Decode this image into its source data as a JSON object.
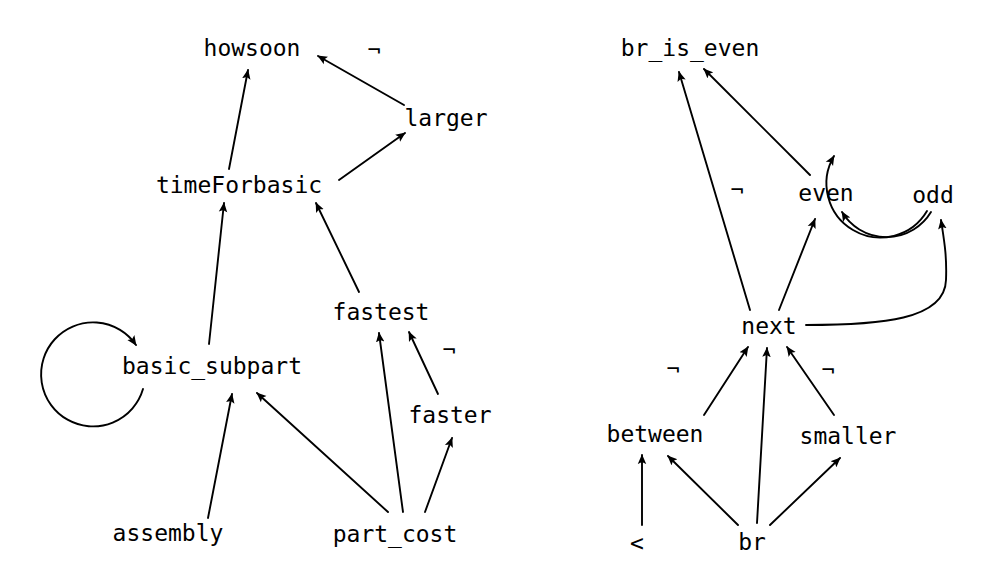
{
  "diagram": {
    "background_color": "#ffffff",
    "stroke_color": "#000000",
    "negation_symbol": "¬",
    "graphs": [
      {
        "id": "left-graph",
        "name": "assembly-cost-dependency-graph",
        "nodes": [
          {
            "id": "howsoon",
            "label": "howsoon",
            "x": 252,
            "y": 48
          },
          {
            "id": "larger",
            "label": "larger",
            "x": 446,
            "y": 118
          },
          {
            "id": "timeForbasic",
            "label": "timeForbasic",
            "x": 239,
            "y": 185
          },
          {
            "id": "fastest",
            "label": "fastest",
            "x": 381,
            "y": 312
          },
          {
            "id": "basic_subpart",
            "label": "basic_subpart",
            "x": 212,
            "y": 366
          },
          {
            "id": "faster",
            "label": "faster",
            "x": 450,
            "y": 415
          },
          {
            "id": "assembly",
            "label": "assembly",
            "x": 168,
            "y": 533
          },
          {
            "id": "part_cost",
            "label": "part_cost",
            "x": 395,
            "y": 534
          }
        ],
        "negations": [
          {
            "id": "neg-larger-howsoon",
            "label": "¬",
            "x": 374,
            "y": 50
          },
          {
            "id": "neg-faster-fastest",
            "label": "¬",
            "x": 449,
            "y": 350
          }
        ],
        "edges": [
          {
            "from": "timeForbasic",
            "to": "howsoon",
            "negated": false,
            "kind": "straight"
          },
          {
            "from": "larger",
            "to": "howsoon",
            "negated": true,
            "kind": "straight"
          },
          {
            "from": "timeForbasic",
            "to": "larger",
            "negated": false,
            "kind": "straight"
          },
          {
            "from": "basic_subpart",
            "to": "timeForbasic",
            "negated": false,
            "kind": "straight"
          },
          {
            "from": "fastest",
            "to": "timeForbasic",
            "negated": false,
            "kind": "straight"
          },
          {
            "from": "basic_subpart",
            "to": "basic_subpart",
            "negated": false,
            "kind": "self-loop"
          },
          {
            "from": "assembly",
            "to": "basic_subpart",
            "negated": false,
            "kind": "straight"
          },
          {
            "from": "part_cost",
            "to": "basic_subpart",
            "negated": false,
            "kind": "straight"
          },
          {
            "from": "part_cost",
            "to": "fastest",
            "negated": false,
            "kind": "straight"
          },
          {
            "from": "part_cost",
            "to": "faster",
            "negated": false,
            "kind": "straight"
          },
          {
            "from": "faster",
            "to": "fastest",
            "negated": true,
            "kind": "straight"
          }
        ]
      },
      {
        "id": "right-graph",
        "name": "br-parity-dependency-graph",
        "nodes": [
          {
            "id": "br_is_even",
            "label": "br_is_even",
            "x": 690,
            "y": 48
          },
          {
            "id": "even",
            "label": "even",
            "x": 826,
            "y": 193
          },
          {
            "id": "odd",
            "label": "odd",
            "x": 933,
            "y": 195
          },
          {
            "id": "next",
            "label": "next",
            "x": 769,
            "y": 326
          },
          {
            "id": "between",
            "label": "between",
            "x": 655,
            "y": 434
          },
          {
            "id": "smaller",
            "label": "smaller",
            "x": 848,
            "y": 436
          },
          {
            "id": "lt",
            "label": "<",
            "x": 637,
            "y": 543
          },
          {
            "id": "br",
            "label": "br",
            "x": 752,
            "y": 542
          }
        ],
        "negations": [
          {
            "id": "neg-next-br_is_even",
            "label": "¬",
            "x": 737,
            "y": 190
          },
          {
            "id": "neg-between-next",
            "label": "¬",
            "x": 673,
            "y": 369
          },
          {
            "id": "neg-smaller-next",
            "label": "¬",
            "x": 828,
            "y": 370
          }
        ],
        "edges": [
          {
            "from": "next",
            "to": "br_is_even",
            "negated": true,
            "kind": "straight"
          },
          {
            "from": "even",
            "to": "br_is_even",
            "negated": false,
            "kind": "straight"
          },
          {
            "from": "even",
            "to": "odd",
            "negated": false,
            "kind": "arc"
          },
          {
            "from": "odd",
            "to": "even",
            "negated": false,
            "kind": "arc"
          },
          {
            "from": "next",
            "to": "even",
            "negated": false,
            "kind": "straight"
          },
          {
            "from": "next",
            "to": "odd",
            "negated": false,
            "kind": "curve"
          },
          {
            "from": "between",
            "to": "next",
            "negated": true,
            "kind": "straight"
          },
          {
            "from": "br",
            "to": "next",
            "negated": false,
            "kind": "straight"
          },
          {
            "from": "smaller",
            "to": "next",
            "negated": true,
            "kind": "straight"
          },
          {
            "from": "lt",
            "to": "between",
            "negated": false,
            "kind": "straight"
          },
          {
            "from": "br",
            "to": "between",
            "negated": false,
            "kind": "straight"
          },
          {
            "from": "br",
            "to": "smaller",
            "negated": false,
            "kind": "straight"
          }
        ]
      }
    ]
  }
}
